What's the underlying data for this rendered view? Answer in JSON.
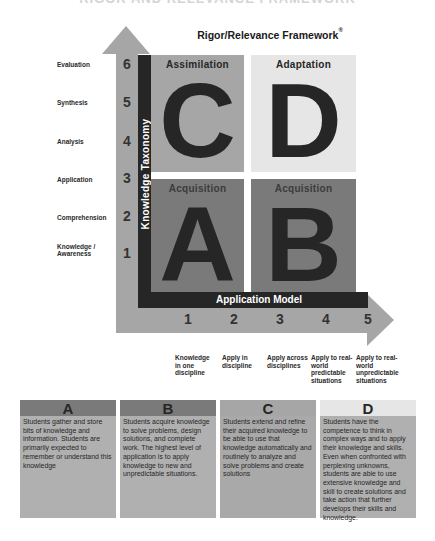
{
  "page": {
    "top_title_partial": "RIGOR AND RELEVANCE FRAMEWORK",
    "framework_title": "Rigor/Relevance Framework",
    "framework_title_mark": "®"
  },
  "axes": {
    "vertical_label": "Knowledge Taxonomy",
    "horizontal_label": "Application Model",
    "y_numbers": [
      "6",
      "5",
      "4",
      "3",
      "2",
      "1"
    ],
    "y_levels": [
      "Evaluation",
      "Synthesis",
      "Analysis",
      "Application",
      "Comprehension",
      "Knowledge / Awareness"
    ],
    "x_numbers": [
      "1",
      "2",
      "3",
      "4",
      "5"
    ],
    "x_levels": [
      "Knowledge in one discipline",
      "Apply in discipline",
      "Apply across disciplines",
      "Apply to real-world predictable situations",
      "Apply to real-world unpredictable situations"
    ]
  },
  "quadrants": {
    "c": {
      "letter": "C",
      "name": "Assimilation",
      "color": "#a6a6a6"
    },
    "d": {
      "letter": "D",
      "name": "Adaptation",
      "color": "#e6e6e6"
    },
    "a": {
      "letter": "A",
      "name": "Acquisition",
      "color": "#7a7a7a"
    },
    "b": {
      "letter": "B",
      "name": "Acquisition",
      "color": "#7a7a7a"
    }
  },
  "descriptions": [
    {
      "letter": "A",
      "text": "Students gather and store bits of knowledge and information. Students are primarily expected to remember or understand this knowledge"
    },
    {
      "letter": "B",
      "text": "Students acquire knowledge to solve problems, design solutions, and complete work. The highest level of application is to apply knowledge to new and unpredictable situations."
    },
    {
      "letter": "C",
      "text": "Students extend and refine their acquired knowledge to be able to use that knowledge automatically and routinely to analyze and solve problems and create solutions"
    },
    {
      "letter": "D",
      "text": "Students have the competence to think in complex ways and to apply their knowledge and skills. Even when confronted with perplexing unknowns, students are able to use extensive knowledge and skill to create solutions and take action that further develops their skills and knowledge."
    }
  ]
}
